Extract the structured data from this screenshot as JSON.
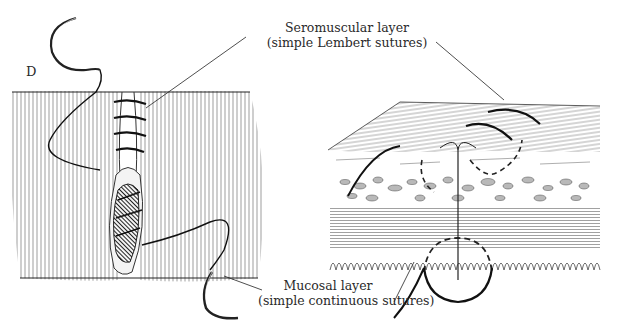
{
  "figure": {
    "panel_letter": "D",
    "labels": {
      "seromuscular_title": "Seromuscular layer",
      "seromuscular_detail": "(simple Lembert sutures)",
      "mucosal_title": "Mucosal layer",
      "mucosal_detail": "(simple continuous sutures)"
    },
    "left_panel": {
      "subject": "intestinal anastomosis exterior view with needle and suture",
      "icons": [
        "curved-needle-icon",
        "curved-needle-icon"
      ]
    },
    "right_panel": {
      "subject": "cross-section of intestinal wall layers with sutures",
      "layers": [
        "serosa",
        "submucosa",
        "muscularis",
        "mucosa"
      ]
    },
    "colors": {
      "ink": "#1a1a1a",
      "hatch": "#555555",
      "background": "#ffffff"
    }
  }
}
